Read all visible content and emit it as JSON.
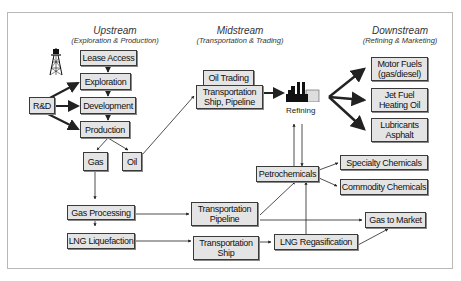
{
  "sections": {
    "upstream": {
      "title": "Upstream",
      "subtitle": "(Exploration & Production)"
    },
    "midstream": {
      "title": "Midstream",
      "subtitle": "(Transportation & Trading)"
    },
    "downstream": {
      "title": "Downstream",
      "subtitle": "(Refining & Marketing)"
    }
  },
  "nodes": {
    "lease_access": "Lease Access",
    "exploration": "Exploration",
    "development": "Development",
    "production": "Production",
    "rnd": "R&D",
    "gas": "Gas",
    "oil": "Oil",
    "gas_processing": "Gas Processing",
    "lng_liquefaction": "LNG Liquefaction",
    "oil_trading": "Oil Trading",
    "transport_ship_pipeline": "Transportation Ship, Pipeline",
    "transport_pipeline": "Transportation Pipeline",
    "transport_ship": "Transportation Ship",
    "refining": "Refining",
    "petrochemicals": "Petrochemicals",
    "lng_regasification": "LNG Regasification",
    "motor_fuels": "Motor Fuels (gas/diesel)",
    "jet_fuel": "Jet Fuel Heating Oil",
    "lubricants": "Lubricants Asphalt",
    "specialty_chemicals": "Specialty Chemicals",
    "commodity_chemicals": "Commodity Chemicals",
    "gas_to_market": "Gas to Market"
  },
  "icons": {
    "oil_rig": "oil-derrick-icon",
    "refinery": "refinery-icon"
  },
  "colors": {
    "box_fill": "#e4e4e4",
    "box_border": "#3a3a3a",
    "frame_border": "#b8b8b8",
    "line": "#222222"
  }
}
